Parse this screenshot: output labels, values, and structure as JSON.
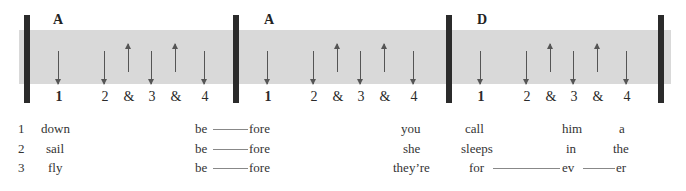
{
  "measures": [
    {
      "chord": "A",
      "counts": [
        "1",
        "2",
        "&",
        "3",
        "&",
        "4"
      ],
      "strokes": [
        "down",
        "down",
        "up",
        "down",
        "up",
        "down"
      ]
    },
    {
      "chord": "A",
      "counts": [
        "1",
        "2",
        "&",
        "3",
        "&",
        "4"
      ],
      "strokes": [
        "down",
        "down",
        "up",
        "down",
        "up",
        "down"
      ]
    },
    {
      "chord": "D",
      "counts": [
        "1",
        "2",
        "&",
        "3",
        "&",
        "4"
      ],
      "strokes": [
        "down",
        "down",
        "up",
        "down",
        "up",
        "down"
      ]
    }
  ],
  "verses": [
    {
      "number": "1",
      "words": [
        "down",
        "be",
        "fore",
        "you",
        "call",
        "him",
        "a"
      ]
    },
    {
      "number": "2",
      "words": [
        "sail",
        "be",
        "fore",
        "she",
        "sleeps",
        "in",
        "the"
      ]
    },
    {
      "number": "3",
      "words": [
        "fly",
        "be",
        "fore",
        "they’re",
        "for",
        "ev",
        "er"
      ]
    }
  ]
}
